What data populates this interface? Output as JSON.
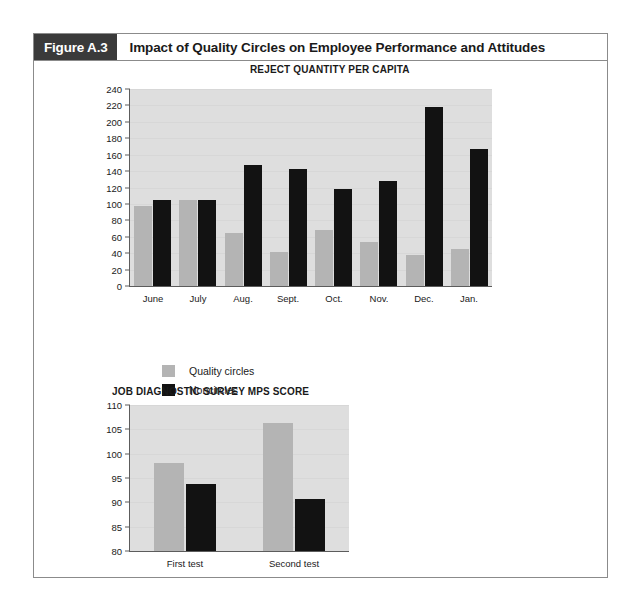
{
  "figure": {
    "number_label": "Figure A.3",
    "title": "Impact of Quality Circles on Employee Performance and Attitudes"
  },
  "legend": {
    "items": [
      {
        "label": "Quality circles",
        "color": "#b4b4b4",
        "swatch": "qc"
      },
      {
        "label": "Noncircles",
        "color": "#121212",
        "swatch": "nc"
      }
    ]
  },
  "chart_data": [
    {
      "id": "reject-quantity-per-capita",
      "type": "bar",
      "title": "REJECT QUANTITY PER CAPITA",
      "xlabel": "",
      "ylabel": "",
      "ylim": [
        0,
        240
      ],
      "ytick_step": 20,
      "yticks": [
        0,
        20,
        40,
        60,
        80,
        100,
        120,
        140,
        160,
        180,
        200,
        220,
        240
      ],
      "grid": true,
      "legend_position": "below-left",
      "categories": [
        "June",
        "July",
        "Aug.",
        "Sept.",
        "Oct.",
        "Nov.",
        "Dec.",
        "Jan."
      ],
      "series": [
        {
          "name": "Quality circles",
          "color": "#b4b4b4",
          "values": [
            98,
            105,
            64,
            42,
            68,
            54,
            38,
            45
          ]
        },
        {
          "name": "Noncircles",
          "color": "#121212",
          "values": [
            105,
            105,
            148,
            142,
            118,
            128,
            218,
            167
          ]
        }
      ]
    },
    {
      "id": "job-diagnostic-survey-mps-score",
      "type": "bar",
      "title": "JOB DIAGNOSTIC SURVEY MPS SCORE",
      "xlabel": "",
      "ylabel": "",
      "ylim": [
        80,
        110
      ],
      "ytick_step": 5,
      "yticks": [
        80,
        85,
        90,
        95,
        100,
        105,
        110
      ],
      "grid": true,
      "legend_position": "none",
      "categories": [
        "First test",
        "Second test"
      ],
      "series": [
        {
          "name": "Quality circles",
          "color": "#b4b4b4",
          "values": [
            98.0,
            106.3
          ]
        },
        {
          "name": "Noncircles",
          "color": "#121212",
          "values": [
            93.8,
            90.7
          ]
        }
      ]
    }
  ]
}
